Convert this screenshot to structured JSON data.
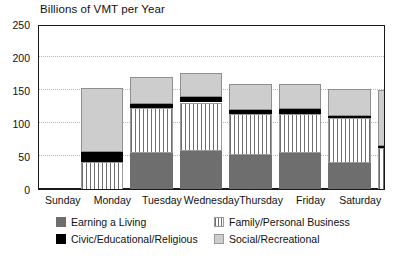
{
  "chart_data": {
    "type": "bar",
    "title": "Billions of VMT per Year",
    "xlabel": "",
    "ylabel": "",
    "stacked": true,
    "grid": true,
    "legend_position": "bottom",
    "ylim": [
      0,
      250
    ],
    "yticks": [
      0,
      50,
      100,
      150,
      200,
      250
    ],
    "categories": [
      "Sunday",
      "Monday",
      "Tuesday",
      "Wednesday",
      "Thursday",
      "Friday",
      "Saturday"
    ],
    "series": [
      {
        "name": "Earning a Living",
        "color": "#6e6e6e",
        "pattern": "solid",
        "values": [
          22,
          96,
          98,
          93,
          95,
          80,
          30
        ]
      },
      {
        "name": "Family/Personal Business",
        "color": "#6e6e6e",
        "pattern": "vertical-stripes",
        "values": [
          60,
          67,
          74,
          62,
          60,
          68,
          73
        ]
      },
      {
        "name": "Civic/Educational/Religious",
        "color": "#000000",
        "pattern": "solid",
        "values": [
          15,
          7,
          8,
          6,
          7,
          4,
          3
        ]
      },
      {
        "name": "Social/Recreational",
        "color": "#cdcdcd",
        "pattern": "solid",
        "values": [
          97,
          41,
          37,
          39,
          38,
          40,
          85
        ]
      }
    ],
    "totals": [
      194,
      211,
      217,
      200,
      200,
      192,
      191
    ]
  }
}
